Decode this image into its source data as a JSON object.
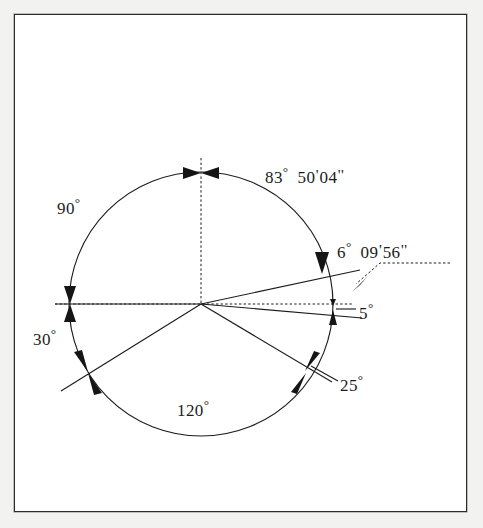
{
  "figure": {
    "type": "angular-dimension-diagram",
    "background_color": "#ffffff",
    "outer_margin_color": "#f2f2f0",
    "line_color": "#1c1c1c",
    "border_color": "#2b2b2b"
  },
  "geometry": {
    "circle": {
      "cx": 201,
      "cy": 304,
      "r": 132
    },
    "axes": [
      {
        "name": "vertical-axis",
        "style": "dashed",
        "from": [
          201,
          160
        ],
        "to": [
          201,
          304
        ]
      },
      {
        "name": "horizontal-axis",
        "style": "dashed",
        "from": [
          57,
          304
        ],
        "to": [
          352,
          304
        ]
      }
    ],
    "rays": [
      {
        "name": "ray-upper-right",
        "angle_deg": 12.2,
        "length": 160
      },
      {
        "name": "ray-five-degree",
        "angle_deg": -5.0,
        "length": 162
      },
      {
        "name": "ray-lower-right",
        "angle_deg": -30.8,
        "length": 152
      },
      {
        "name": "ray-lower-left",
        "angle_deg": -150.8,
        "length": 148
      }
    ],
    "arrow_markers": [
      {
        "name": "arrows-top",
        "at": [
          201,
          172
        ]
      },
      {
        "name": "arrows-left",
        "at": [
          70,
          304
        ]
      },
      {
        "name": "arrows-lower-left",
        "at": [
          88,
          373
        ]
      },
      {
        "name": "arrows-lower-right",
        "at": [
          305,
          372
        ]
      },
      {
        "name": "arrow-upper-right",
        "at": [
          322,
          272
        ]
      },
      {
        "name": "arrows-five-degree",
        "at": [
          333,
          310
        ]
      }
    ]
  },
  "labels": {
    "ninety": {
      "text": "90",
      "unit": "°",
      "x": 57,
      "y": 196
    },
    "eightythree": {
      "degrees": "83",
      "deg_sym": "°",
      "minutes": "50",
      "min_sym": "'",
      "seconds": "04",
      "sec_sym": "''",
      "x": 265,
      "y": 165
    },
    "six": {
      "degrees": "6",
      "deg_sym": "°",
      "minutes": "09",
      "min_sym": "'",
      "seconds": "56",
      "sec_sym": "''",
      "x": 337,
      "y": 240
    },
    "five": {
      "text": "5",
      "unit": "°",
      "x": 359,
      "y": 308
    },
    "twentyfive": {
      "text": "25",
      "unit": "°",
      "x": 340,
      "y": 380
    },
    "thirty": {
      "text": "30",
      "unit": "°",
      "x": 33,
      "y": 334
    },
    "onetwenty": {
      "text": "120",
      "unit": "°",
      "x": 177,
      "y": 402
    }
  }
}
